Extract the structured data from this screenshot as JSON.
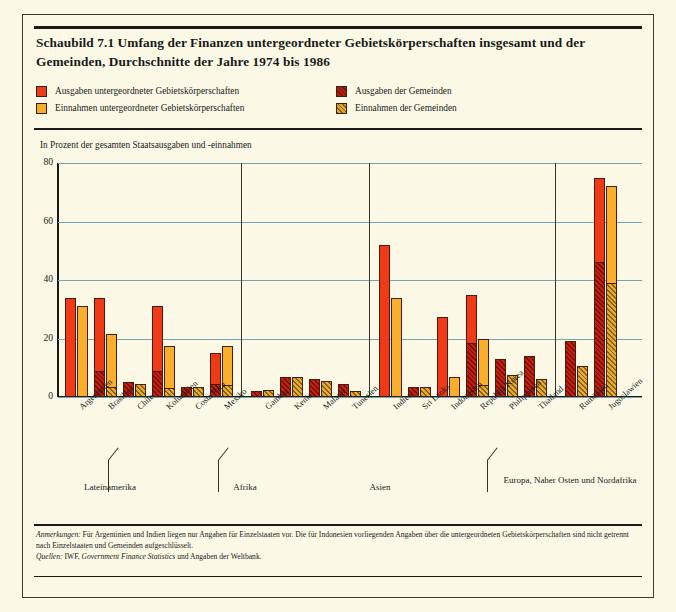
{
  "title": "Schaubild 7.1 Umfang der Finanzen untergeordneter Gebietskörperschaften insgesamt und der Gemeinden, Durchschnitte der Jahre 1974 bis 1986",
  "legend": [
    {
      "key": "exp_sub",
      "label": "Ausgaben untergeordneter Gebietskörperschaften",
      "color": "#ef3b18"
    },
    {
      "key": "rev_sub",
      "label": "Einnahmen untergeordneter Gebietskörperschaften",
      "color": "#f6ad2b"
    },
    {
      "key": "exp_mun",
      "label": "Ausgaben der Gemeinden",
      "color": "#b41d12"
    },
    {
      "key": "rev_mun",
      "label": "Einnahmen der Gemeinden",
      "color": "#e0a82c"
    }
  ],
  "axis_note": "In Prozent der gesamten Staatsausgaben und -einnahmen",
  "regions": [
    {
      "label": "Lateinamerika"
    },
    {
      "label": "Afrika"
    },
    {
      "label": "Asien"
    },
    {
      "label": "Europa, Naher Osten und Nordafrika"
    }
  ],
  "notes": {
    "anmerkungen_label": "Anmerkungen:",
    "anmerkungen_text": " Für Argentinien und Indien liegen nur Angaben für Einzelstaaten vor. Die für Indonesien vorliegenden Angaben über die untergeordneten Gebietskörperschaften sind nicht getrennt nach Einzelstaaten und Gemeinden aufgeschlüsselt.",
    "quellen_label": "Quellen:",
    "quellen_text_a": " IWF, ",
    "quellen_italic": "Government Finance Statistics",
    "quellen_text_b": " und Angaben der Weltbank."
  },
  "chart_data": {
    "type": "bar",
    "title": "Schaubild 7.1 Umfang der Finanzen untergeordneter Gebietskörperschaften insgesamt und der Gemeinden, Durchschnitte der Jahre 1974 bis 1986",
    "xlabel": "",
    "ylabel": "In Prozent der gesamten Staatsausgaben und -einnahmen",
    "ylim": [
      0,
      80
    ],
    "yticks": [
      0,
      20,
      40,
      60,
      80
    ],
    "grid": true,
    "legend_position": "top",
    "categories": [
      "Argentinien",
      "Brasilien",
      "Chile",
      "Kolumbien",
      "Costa Rica",
      "Mexiko",
      "Gambia",
      "Kenia",
      "Malawi",
      "Tunesien",
      "Indien",
      "Sri Lanka",
      "Indonesien",
      "Republik Korea",
      "Philippinen",
      "Thailand",
      "Rumänien",
      "Jugoslawien"
    ],
    "category_regions": [
      "Lateinamerika",
      "Lateinamerika",
      "Lateinamerika",
      "Lateinamerika",
      "Lateinamerika",
      "Lateinamerika",
      "Afrika",
      "Afrika",
      "Afrika",
      "Afrika",
      "Asien",
      "Asien",
      "Asien",
      "Asien",
      "Asien",
      "Asien",
      "Europa, Naher Osten und Nordafrika",
      "Europa, Naher Osten und Nordafrika"
    ],
    "series": [
      {
        "name": "Ausgaben untergeordneter Gebietskörperschaften",
        "key": "exp_sub",
        "color": "#f03a16",
        "values": [
          34,
          34,
          5,
          31,
          3.5,
          15,
          2,
          7,
          6,
          4.5,
          52,
          3.5,
          27.5,
          35,
          13,
          14,
          19,
          75
        ]
      },
      {
        "name": "Einnahmen untergeordneter Gebietskörperschaften",
        "key": "rev_sub",
        "color": "#f9ae2c",
        "values": [
          31,
          21.5,
          4.5,
          17.5,
          3.5,
          17.5,
          2.5,
          7,
          5.5,
          2,
          34,
          3.5,
          7,
          20,
          7.5,
          6,
          10.5,
          72
        ]
      },
      {
        "name": "Ausgaben der Gemeinden",
        "key": "exp_mun",
        "color": "#bf2011",
        "values": [
          0,
          9,
          5,
          9,
          3.5,
          4.5,
          2,
          7,
          6,
          4.5,
          0,
          3.5,
          0,
          18.5,
          13,
          14,
          19,
          46
        ]
      },
      {
        "name": "Einnahmen der Gemeinden",
        "key": "rev_mun",
        "color": "#e3ad30",
        "values": [
          0,
          3.5,
          4.5,
          3,
          3.5,
          4,
          2.5,
          7,
          5.5,
          2,
          0,
          3.5,
          0,
          4,
          7.5,
          6,
          10.5,
          39
        ]
      }
    ]
  }
}
